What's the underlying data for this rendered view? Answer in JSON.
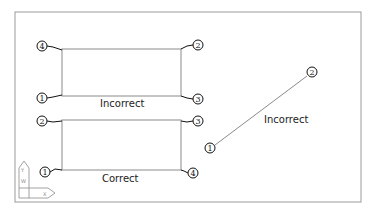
{
  "diagram": {
    "frame": {
      "x": 15,
      "y": 12,
      "w": 346,
      "h": 190,
      "color": "#9a9a9a"
    },
    "line_color": "#8a8a8a",
    "leader_color": "#111111",
    "groups": [
      {
        "name": "upper-rectangle",
        "label": "Incorrect",
        "rect": {
          "x1": 62,
          "y1": 49,
          "x2": 181,
          "y2": 96
        },
        "label_pos": {
          "x": 103,
          "y": 106
        },
        "points": [
          {
            "id": "4",
            "cx": 42,
            "cy": 46,
            "corner": [
              62,
              49
            ]
          },
          {
            "id": "2",
            "cx": 198,
            "cy": 45,
            "corner": [
              181,
              49
            ]
          },
          {
            "id": "1",
            "cx": 42,
            "cy": 98,
            "corner": [
              62,
              96
            ]
          },
          {
            "id": "3",
            "cx": 198,
            "cy": 99,
            "corner": [
              181,
              96
            ]
          }
        ]
      },
      {
        "name": "lower-rectangle",
        "label": "Correct",
        "rect": {
          "x1": 62,
          "y1": 120,
          "x2": 181,
          "y2": 170
        },
        "label_pos": {
          "x": 103,
          "y": 180
        },
        "points": [
          {
            "id": "2",
            "cx": 42,
            "cy": 121,
            "corner": [
              62,
              120
            ]
          },
          {
            "id": "3",
            "cx": 198,
            "cy": 121,
            "corner": [
              181,
              120
            ]
          },
          {
            "id": "1",
            "cx": 45,
            "cy": 172,
            "corner": [
              62,
              170
            ]
          },
          {
            "id": "4",
            "cx": 193,
            "cy": 173,
            "corner": [
              181,
              170
            ]
          }
        ]
      },
      {
        "name": "diagonal-line",
        "label": "Incorrect",
        "line": {
          "x1": 216,
          "y1": 144,
          "x2": 306,
          "y2": 77
        },
        "label_pos": {
          "x": 264,
          "y": 122
        },
        "points": [
          {
            "id": "1",
            "cx": 210,
            "cy": 148
          },
          {
            "id": "2",
            "cx": 312,
            "cy": 72
          }
        ]
      }
    ],
    "ucs_icon": {
      "name": "ucs-icon",
      "x_label": "X",
      "y_label": "Y",
      "w_label": "W"
    }
  }
}
